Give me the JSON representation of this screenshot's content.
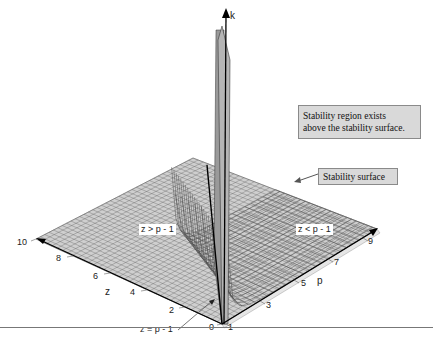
{
  "figure": {
    "type": "3d-surface-plot",
    "axes": {
      "k": {
        "label": "k"
      },
      "z": {
        "label": "z",
        "ticks": [
          "0",
          "2",
          "4",
          "6",
          "8",
          "10"
        ]
      },
      "p": {
        "label": "p",
        "ticks": [
          "1",
          "3",
          "5",
          "7",
          "9"
        ]
      }
    },
    "regions": {
      "left": "z > p - 1",
      "right": "z < p - 1",
      "boundary": "z = p - 1"
    },
    "callouts": {
      "region_line1": "Stability region exists",
      "region_line2": "above the stability surface.",
      "surface": "Stability surface"
    },
    "colors": {
      "surface_fill": "#c8c8c8",
      "grid_line": "#555555",
      "axis": "#000000",
      "callout_bg": "#d9d9d9"
    }
  }
}
